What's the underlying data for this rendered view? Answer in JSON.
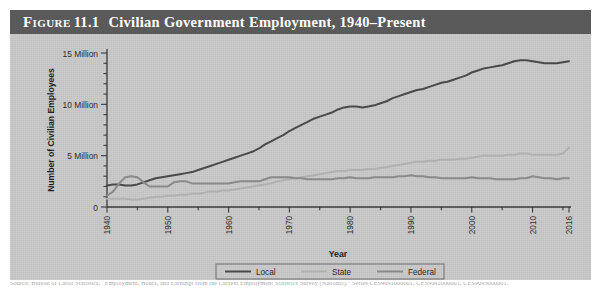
{
  "figure": {
    "label_word": "Figure",
    "number": "11.1",
    "title": "Civilian Government Employment, 1940–Present",
    "caption": "Source: Bureau of Labor Statistics, “Employment, Hours, and Earnings from the Current Employment Statistics Survey (National),” Series CES9091000001, CES9092000001, CES9093000001."
  },
  "colors": {
    "panel_background": "#c9c9c9",
    "title_bar": "#5a5a5a",
    "title_text": "#ffffff",
    "axis": "#3a3a3a",
    "local": "#4a4a4a",
    "state": "#b0b0b0",
    "federal": "#8a8a8a",
    "legend_border": "#6e6e6e"
  },
  "chart_data": {
    "type": "line",
    "title": "Civilian Government Employment, 1940–Present",
    "xlabel": "Year",
    "ylabel": "Number of Civilian Employees",
    "xlim": [
      1940,
      2016
    ],
    "ylim": [
      0,
      15
    ],
    "y_unit": "Million",
    "grid": false,
    "legend_position": "bottom-center",
    "y_ticks": [
      0,
      5,
      10,
      15
    ],
    "y_tick_labels": [
      "0",
      "5 Million",
      "10 Million",
      "15 Million"
    ],
    "y_minor_tick_step": 1,
    "x_ticks": [
      1940,
      1950,
      1960,
      1970,
      1980,
      1990,
      2000,
      2010,
      2016
    ],
    "x_tick_labels": [
      "1940",
      "1950",
      "1960",
      "1970",
      "1980",
      "1990",
      "2000",
      "2010",
      "2016"
    ],
    "x_minor_tick_step": 5,
    "x_tick_label_rotation": -90,
    "x": [
      1940,
      1941,
      1942,
      1943,
      1944,
      1945,
      1946,
      1947,
      1948,
      1949,
      1950,
      1951,
      1952,
      1953,
      1954,
      1955,
      1956,
      1957,
      1958,
      1959,
      1960,
      1961,
      1962,
      1963,
      1964,
      1965,
      1966,
      1967,
      1968,
      1969,
      1970,
      1971,
      1972,
      1973,
      1974,
      1975,
      1976,
      1977,
      1978,
      1979,
      1980,
      1981,
      1982,
      1983,
      1984,
      1985,
      1986,
      1987,
      1988,
      1989,
      1990,
      1991,
      1992,
      1993,
      1994,
      1995,
      1996,
      1997,
      1998,
      1999,
      2000,
      2001,
      2002,
      2003,
      2004,
      2005,
      2006,
      2007,
      2008,
      2009,
      2010,
      2011,
      2012,
      2013,
      2014,
      2015,
      2016
    ],
    "series": [
      {
        "name": "Local",
        "color": "#4a4a4a",
        "width": 2.0,
        "values": [
          2.1,
          2.2,
          2.2,
          2.1,
          2.1,
          2.2,
          2.4,
          2.6,
          2.8,
          2.9,
          3.0,
          3.1,
          3.2,
          3.3,
          3.4,
          3.6,
          3.8,
          4.0,
          4.2,
          4.4,
          4.6,
          4.8,
          5.0,
          5.2,
          5.4,
          5.7,
          6.1,
          6.4,
          6.7,
          7.0,
          7.4,
          7.7,
          8.0,
          8.3,
          8.6,
          8.8,
          9.0,
          9.2,
          9.5,
          9.7,
          9.8,
          9.8,
          9.7,
          9.8,
          9.9,
          10.1,
          10.3,
          10.6,
          10.8,
          11.0,
          11.2,
          11.4,
          11.5,
          11.7,
          11.9,
          12.1,
          12.2,
          12.4,
          12.6,
          12.8,
          13.1,
          13.3,
          13.5,
          13.6,
          13.7,
          13.8,
          14.0,
          14.2,
          14.3,
          14.3,
          14.2,
          14.1,
          14.0,
          14.0,
          14.0,
          14.1,
          14.2
        ]
      },
      {
        "name": "State",
        "color": "#b0b0b0",
        "width": 2.0,
        "values": [
          0.8,
          0.8,
          0.8,
          0.8,
          0.7,
          0.7,
          0.8,
          0.9,
          1.0,
          1.0,
          1.1,
          1.1,
          1.2,
          1.2,
          1.3,
          1.3,
          1.4,
          1.5,
          1.5,
          1.6,
          1.6,
          1.7,
          1.8,
          1.9,
          2.0,
          2.1,
          2.2,
          2.3,
          2.5,
          2.6,
          2.7,
          2.8,
          2.9,
          3.0,
          3.1,
          3.2,
          3.3,
          3.4,
          3.5,
          3.5,
          3.6,
          3.6,
          3.6,
          3.7,
          3.7,
          3.8,
          3.9,
          4.0,
          4.1,
          4.2,
          4.3,
          4.4,
          4.4,
          4.5,
          4.5,
          4.6,
          4.6,
          4.6,
          4.7,
          4.7,
          4.8,
          4.9,
          5.0,
          5.0,
          5.0,
          5.0,
          5.1,
          5.1,
          5.2,
          5.2,
          5.1,
          5.1,
          5.1,
          5.1,
          5.1,
          5.2,
          5.8
        ]
      },
      {
        "name": "Federal",
        "color": "#8a8a8a",
        "width": 2.0,
        "values": [
          1.1,
          1.5,
          2.3,
          2.9,
          3.0,
          2.9,
          2.4,
          2.0,
          2.0,
          2.0,
          2.0,
          2.4,
          2.5,
          2.5,
          2.3,
          2.3,
          2.3,
          2.3,
          2.3,
          2.3,
          2.3,
          2.4,
          2.5,
          2.5,
          2.5,
          2.5,
          2.7,
          2.9,
          2.9,
          2.9,
          2.9,
          2.8,
          2.8,
          2.7,
          2.7,
          2.7,
          2.7,
          2.7,
          2.8,
          2.8,
          2.9,
          2.8,
          2.8,
          2.8,
          2.9,
          2.9,
          2.9,
          2.9,
          3.0,
          3.0,
          3.1,
          3.0,
          3.0,
          2.9,
          2.9,
          2.8,
          2.8,
          2.8,
          2.8,
          2.8,
          2.9,
          2.8,
          2.8,
          2.8,
          2.7,
          2.7,
          2.7,
          2.7,
          2.8,
          2.8,
          3.0,
          2.9,
          2.8,
          2.8,
          2.7,
          2.8,
          2.8
        ]
      }
    ],
    "legend": [
      {
        "label": "Local",
        "color": "#4a4a4a"
      },
      {
        "label": "State",
        "color": "#b0b0b0"
      },
      {
        "label": "Federal",
        "color": "#8a8a8a"
      }
    ]
  }
}
